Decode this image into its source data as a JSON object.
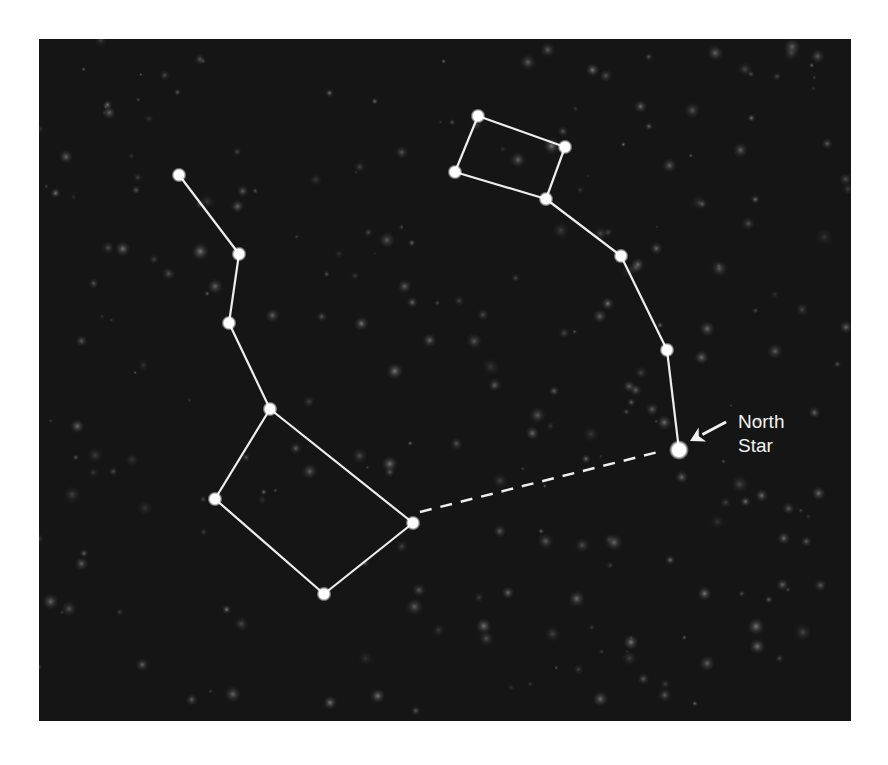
{
  "colors": {
    "background": "#ffffff",
    "sky": "#151515",
    "line": "#eeeeee",
    "star": "#ffffff"
  },
  "label": {
    "line1": "North",
    "line2": "Star"
  },
  "constellations": {
    "big_dipper": {
      "name": "big-dipper",
      "stars": [
        [
          179,
          175
        ],
        [
          239,
          254
        ],
        [
          229,
          323
        ],
        [
          270,
          409
        ],
        [
          215,
          499
        ],
        [
          324,
          594
        ],
        [
          413,
          523
        ]
      ],
      "lines": [
        [
          0,
          1
        ],
        [
          1,
          2
        ],
        [
          2,
          3
        ],
        [
          3,
          4
        ],
        [
          4,
          5
        ],
        [
          5,
          6
        ],
        [
          6,
          3
        ]
      ]
    },
    "little_dipper": {
      "name": "little-dipper",
      "stars": [
        [
          478,
          116
        ],
        [
          565,
          147
        ],
        [
          546,
          199
        ],
        [
          455,
          172
        ],
        [
          621,
          256
        ],
        [
          667,
          350
        ],
        [
          679,
          450
        ]
      ],
      "lines": [
        [
          0,
          1
        ],
        [
          1,
          2
        ],
        [
          2,
          3
        ],
        [
          3,
          0
        ],
        [
          2,
          4
        ],
        [
          4,
          5
        ],
        [
          5,
          6
        ]
      ]
    }
  },
  "pointer_line": {
    "from": [
      420,
      512
    ],
    "to": [
      662,
      451
    ]
  },
  "arrow": {
    "from": [
      726,
      422
    ],
    "to": [
      690,
      441
    ]
  },
  "north_star": [
    679,
    450
  ]
}
